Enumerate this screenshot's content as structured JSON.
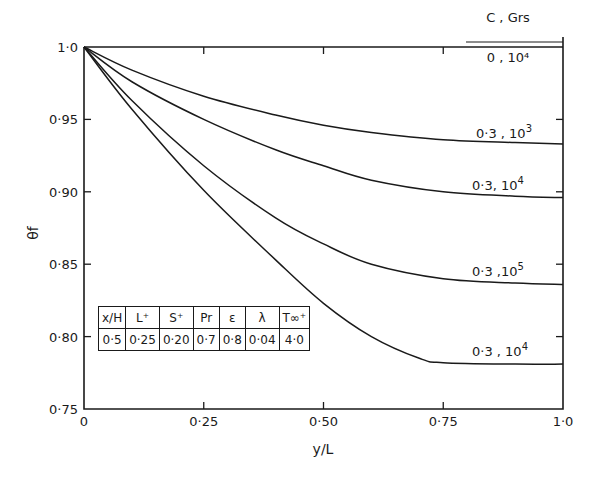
{
  "chart_data": {
    "type": "line",
    "title": "",
    "xlabel": "y/L",
    "ylabel": "θf",
    "xlim": [
      0,
      1.0
    ],
    "ylim": [
      0.75,
      1.0
    ],
    "grid": false,
    "x_ticks": [
      "0",
      "0·25",
      "0·50",
      "0·75",
      "1·0"
    ],
    "y_ticks": [
      "1·0",
      "0·95",
      "0·90",
      "0·85",
      "0·80",
      "0·75"
    ],
    "legend_header": {
      "line1": "C , Grs",
      "line2": "0 , 10⁴"
    },
    "series": [
      {
        "name": "C=0, Grs=10^4",
        "label": "0 , 10⁴",
        "x": [
          0,
          1.0
        ],
        "y": [
          1.0,
          1.0
        ]
      },
      {
        "name": "C=0.3, Grs=10^3",
        "label_base": "0·3 , 10",
        "label_exp": "3",
        "x": [
          0,
          0.1,
          0.25,
          0.4,
          0.5,
          0.6,
          0.75,
          0.9,
          1.0
        ],
        "y": [
          1.0,
          0.984,
          0.966,
          0.953,
          0.946,
          0.941,
          0.936,
          0.934,
          0.933
        ]
      },
      {
        "name": "C=0.3, Grs=10^4 (upper)",
        "label_base": "0·3, 10",
        "label_exp": "4",
        "x": [
          0,
          0.1,
          0.25,
          0.4,
          0.5,
          0.6,
          0.75,
          0.9,
          1.0
        ],
        "y": [
          1.0,
          0.976,
          0.95,
          0.929,
          0.918,
          0.908,
          0.9,
          0.897,
          0.896
        ]
      },
      {
        "name": "C=0.3, Grs=10^5",
        "label_base": "0·3 ,10",
        "label_exp": "5",
        "x": [
          0,
          0.1,
          0.25,
          0.4,
          0.5,
          0.6,
          0.75,
          0.9,
          1.0
        ],
        "y": [
          1.0,
          0.963,
          0.918,
          0.882,
          0.864,
          0.85,
          0.84,
          0.837,
          0.836
        ]
      },
      {
        "name": "C=0.3, Grs=10^4 (lower)",
        "label_base": "0·3 , 10",
        "label_exp": "4",
        "x": [
          0,
          0.1,
          0.25,
          0.4,
          0.5,
          0.6,
          0.7,
          0.75,
          0.9,
          1.0
        ],
        "y": [
          1.0,
          0.957,
          0.901,
          0.853,
          0.823,
          0.8,
          0.785,
          0.782,
          0.781,
          0.781
        ]
      }
    ],
    "parameter_table": {
      "headers": [
        "x/H",
        "L⁺",
        "S⁺",
        "Pr",
        "ε",
        "λ",
        "T∞⁺"
      ],
      "values": [
        "0·5",
        "0·25",
        "0·20",
        "0·7",
        "0·8",
        "0·04",
        "4·0"
      ]
    }
  }
}
